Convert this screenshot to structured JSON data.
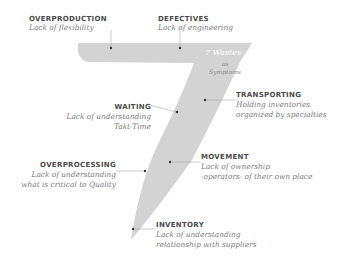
{
  "center": {
    "title": "7 Wastes",
    "subtitle_line1": "as",
    "subtitle_line2": "Symptoms"
  },
  "colors": {
    "shape_fill": "#d3d3d3",
    "title_text": "#4a4a4a",
    "desc_text": "#7a7a7a",
    "leader_line": "#9a9a9a",
    "dot": "#333333"
  },
  "wastes": [
    {
      "id": "overproduction",
      "title": "OVERPRODUCTION",
      "line1": "Lack of flexibility",
      "line2": ""
    },
    {
      "id": "defectives",
      "title": "DEFECTIVES",
      "line1": "Lack of engineering",
      "line2": ""
    },
    {
      "id": "transporting",
      "title": "TRANSPORTING",
      "line1": "Holding inventories",
      "line2": "organized by specialties"
    },
    {
      "id": "waiting",
      "title": "WAITING",
      "line1": "Lack of understanding",
      "line2": "Takt-Time"
    },
    {
      "id": "overprocessing",
      "title": "OVERPROCESSING",
      "line1": "Lack of understanding",
      "line2": "what is critical to Quality"
    },
    {
      "id": "movement",
      "title": "MOVEMENT",
      "line1": "Lack of ownership",
      "line2": "-operators- of their own place"
    },
    {
      "id": "inventory",
      "title": "INVENTORY",
      "line1": "Lack of understanding",
      "line2": "relationship  with suppliers"
    }
  ]
}
